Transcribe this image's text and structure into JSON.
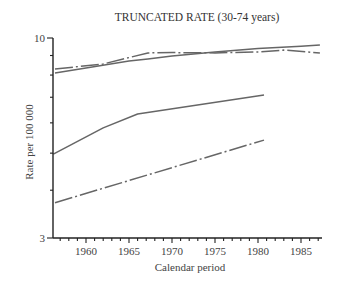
{
  "chart_data": {
    "type": "line",
    "title": "TRUNCATED RATE (30-74 years)",
    "xlabel": "Calendar period",
    "ylabel": "Rate per 100 000",
    "yscale": "log",
    "ylim": [
      3,
      10
    ],
    "xlim": [
      1956.2,
      1987.5
    ],
    "y_tick_labels": [
      "10",
      "3"
    ],
    "y_minor_ticks": [
      4,
      5,
      6,
      7,
      8,
      9
    ],
    "x_tick_labels": [
      "1960",
      "1965",
      "1970",
      "1975",
      "1980",
      "1985"
    ],
    "x_ticks": [
      1960,
      1965,
      1970,
      1975,
      1980,
      1985
    ],
    "grid": false,
    "legend": null,
    "series": [
      {
        "name": "upper-solid",
        "style": "solid",
        "x": [
          1956.4,
          1960,
          1965,
          1967.2,
          1970,
          1975,
          1980,
          1985,
          1987.2
        ],
        "y": [
          8.1,
          8.35,
          8.7,
          8.81,
          8.98,
          9.2,
          9.38,
          9.52,
          9.59
        ]
      },
      {
        "name": "upper-dash-dot",
        "style": "dashdot",
        "x": [
          1956.4,
          1962,
          1967.2,
          1970,
          1975,
          1980,
          1983,
          1987.2
        ],
        "y": [
          8.3,
          8.55,
          9.14,
          9.16,
          9.14,
          9.2,
          9.3,
          9.14
        ]
      },
      {
        "name": "lower-solid",
        "style": "solid",
        "x": [
          1956.2,
          1962,
          1966,
          1980.7
        ],
        "y": [
          4.97,
          5.82,
          6.33,
          7.1
        ]
      },
      {
        "name": "lower-dash-dot",
        "style": "dashdot",
        "x": [
          1956.4,
          1980.7
        ],
        "y": [
          3.71,
          5.41
        ]
      }
    ]
  }
}
